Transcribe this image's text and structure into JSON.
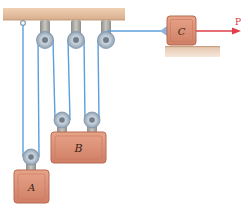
{
  "diagram": {
    "title": "",
    "labels": {
      "block_a": "A",
      "block_b": "B",
      "block_c": "C",
      "force": "P"
    },
    "colors": {
      "beam": "#e9c3a2",
      "beam_shadow": "#cfa888",
      "block_fill": "#d98e74",
      "block_inner": "#e6a58c",
      "block_edge": "#b86a52",
      "rope": "#5b9fdc",
      "pulley": "#b9c4cf",
      "hanger": "#a9a7a2",
      "force_arrow": "#df3e4a",
      "ground": "#e2c2a6"
    },
    "components": [
      "ceiling-beam",
      "fixed-pulley-1",
      "fixed-pulley-2",
      "fixed-pulley-3",
      "movable-pulley-a",
      "movable-pulley-b-left",
      "movable-pulley-b-right",
      "block-a",
      "block-b",
      "block-c",
      "ground-surface",
      "force-p"
    ]
  }
}
